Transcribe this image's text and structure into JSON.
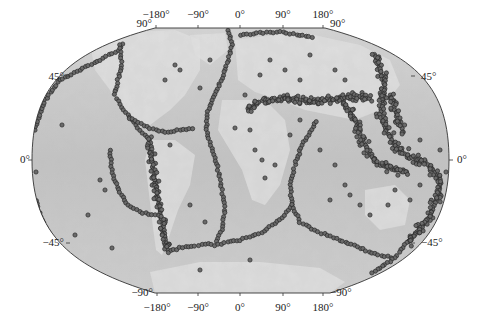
{
  "map": {
    "title": "",
    "projection": "winkel-like global",
    "frame": {
      "left": 32,
      "right": 449,
      "top": 28,
      "bottom": 293,
      "equator_y": 160,
      "top_flat": [
        155,
        325
      ],
      "bottom_flat": [
        155,
        330
      ]
    },
    "colors": {
      "ocean": "#c4c4c4",
      "land": "#e2e2e2",
      "land_high": "#f2f2f2",
      "dot_fill": "#6a6a6a",
      "dot_stroke": "#2a2a2a",
      "outline": "#333333"
    },
    "labels": {
      "top_lon": [
        {
          "text": "−180°",
          "x": 156,
          "y": 13
        },
        {
          "text": "−90°",
          "x": 198,
          "y": 13
        },
        {
          "text": "0°",
          "x": 240,
          "y": 13
        },
        {
          "text": "90°",
          "x": 283,
          "y": 13
        },
        {
          "text": "180°",
          "x": 323,
          "y": 13
        }
      ],
      "top_lat_left": {
        "text": "90°",
        "x": 150,
        "y": 23
      },
      "top_lat_right": {
        "text": "90°",
        "x": 332,
        "y": 23
      },
      "bottom_lon": [
        {
          "text": "−180°",
          "x": 157,
          "y": 300
        },
        {
          "text": "−90°",
          "x": 198,
          "y": 300
        },
        {
          "text": "0°",
          "x": 240,
          "y": 300
        },
        {
          "text": "90°",
          "x": 283,
          "y": 300
        },
        {
          "text": "180°",
          "x": 323,
          "y": 300
        }
      ],
      "bottom_lat_left": {
        "text": "−90°",
        "x": 150,
        "y": 290
      },
      "bottom_lat_right": {
        "text": "−90°",
        "x": 332,
        "y": 290
      },
      "left_lat": [
        {
          "text": "45°",
          "x": 62,
          "y": 72
        },
        {
          "text": "0°",
          "x": 30,
          "y": 155
        },
        {
          "text": "−45°",
          "x": 62,
          "y": 237
        }
      ],
      "right_lat": [
        {
          "text": "45°",
          "x": 420,
          "y": 72
        },
        {
          "text": "0°",
          "x": 455,
          "y": 155
        },
        {
          "text": "−45°",
          "x": 420,
          "y": 237
        }
      ]
    },
    "landmasses": [
      {
        "name": "north-america",
        "points": [
          [
            90,
            45
          ],
          [
            130,
            32
          ],
          [
            175,
            30
          ],
          [
            200,
            40
          ],
          [
            200,
            70
          ],
          [
            185,
            95
          ],
          [
            170,
            110
          ],
          [
            150,
            125
          ],
          [
            135,
            125
          ],
          [
            120,
            110
          ],
          [
            110,
            90
          ],
          [
            95,
            70
          ]
        ]
      },
      {
        "name": "south-america",
        "points": [
          [
            150,
            140
          ],
          [
            175,
            140
          ],
          [
            195,
            155
          ],
          [
            190,
            185
          ],
          [
            178,
            210
          ],
          [
            168,
            240
          ],
          [
            162,
            255
          ],
          [
            156,
            250
          ],
          [
            152,
            220
          ],
          [
            148,
            185
          ],
          [
            145,
            160
          ]
        ]
      },
      {
        "name": "greenland",
        "points": [
          [
            190,
            35
          ],
          [
            225,
            33
          ],
          [
            228,
            50
          ],
          [
            210,
            65
          ],
          [
            195,
            55
          ]
        ]
      },
      {
        "name": "eurasia",
        "points": [
          [
            235,
            40
          ],
          [
            300,
            32
          ],
          [
            360,
            45
          ],
          [
            390,
            60
          ],
          [
            400,
            85
          ],
          [
            380,
            110
          ],
          [
            355,
            120
          ],
          [
            330,
            115
          ],
          [
            305,
            110
          ],
          [
            280,
            100
          ],
          [
            255,
            92
          ],
          [
            238,
            80
          ]
        ]
      },
      {
        "name": "africa",
        "points": [
          [
            222,
            100
          ],
          [
            265,
            100
          ],
          [
            285,
            120
          ],
          [
            290,
            150
          ],
          [
            280,
            185
          ],
          [
            265,
            205
          ],
          [
            252,
            200
          ],
          [
            242,
            170
          ],
          [
            230,
            150
          ],
          [
            218,
            130
          ]
        ]
      },
      {
        "name": "australia",
        "points": [
          [
            365,
            190
          ],
          [
            395,
            185
          ],
          [
            410,
            200
          ],
          [
            405,
            225
          ],
          [
            380,
            230
          ],
          [
            365,
            215
          ]
        ]
      },
      {
        "name": "antarctica",
        "points": [
          [
            150,
            272
          ],
          [
            200,
            262
          ],
          [
            260,
            262
          ],
          [
            320,
            268
          ],
          [
            345,
            282
          ],
          [
            330,
            293
          ],
          [
            155,
            293
          ]
        ]
      }
    ],
    "seismic_belts": [
      {
        "name": "aleutian-alaska",
        "points": [
          [
            35,
            130
          ],
          [
            45,
            100
          ],
          [
            60,
            80
          ],
          [
            80,
            70
          ],
          [
            100,
            60
          ],
          [
            118,
            50
          ],
          [
            125,
            42
          ]
        ]
      },
      {
        "name": "north-american-west",
        "points": [
          [
            120,
            45
          ],
          [
            122,
            65
          ],
          [
            118,
            80
          ],
          [
            115,
            95
          ],
          [
            120,
            105
          ],
          [
            130,
            118
          ],
          [
            140,
            130
          ],
          [
            150,
            140
          ]
        ]
      },
      {
        "name": "central-america-caribbean",
        "points": [
          [
            130,
            118
          ],
          [
            150,
            128
          ],
          [
            165,
            132
          ],
          [
            180,
            130
          ],
          [
            195,
            128
          ]
        ]
      },
      {
        "name": "andes",
        "points": [
          [
            150,
            140
          ],
          [
            152,
            160
          ],
          [
            155,
            180
          ],
          [
            158,
            200
          ],
          [
            162,
            220
          ],
          [
            166,
            240
          ],
          [
            168,
            252
          ]
        ]
      },
      {
        "name": "east-pacific-rise",
        "points": [
          [
            110,
            150
          ],
          [
            112,
            170
          ],
          [
            118,
            190
          ],
          [
            128,
            205
          ],
          [
            140,
            212
          ],
          [
            155,
            215
          ],
          [
            165,
            218
          ]
        ]
      },
      {
        "name": "scotia-arc",
        "points": [
          [
            168,
            252
          ],
          [
            180,
            248
          ],
          [
            195,
            246
          ],
          [
            205,
            244
          ],
          [
            215,
            245
          ]
        ]
      },
      {
        "name": "mid-atlantic-ridge",
        "points": [
          [
            228,
            30
          ],
          [
            232,
            45
          ],
          [
            228,
            60
          ],
          [
            222,
            78
          ],
          [
            215,
            95
          ],
          [
            208,
            112
          ],
          [
            206,
            130
          ],
          [
            212,
            148
          ],
          [
            218,
            170
          ],
          [
            222,
            190
          ],
          [
            225,
            210
          ],
          [
            222,
            230
          ],
          [
            215,
            245
          ]
        ]
      },
      {
        "name": "southwest-indian-ridge",
        "points": [
          [
            215,
            245
          ],
          [
            240,
            240
          ],
          [
            262,
            232
          ],
          [
            280,
            220
          ],
          [
            292,
            205
          ]
        ]
      },
      {
        "name": "carlsberg-central-indian",
        "points": [
          [
            292,
            205
          ],
          [
            290,
            185
          ],
          [
            295,
            165
          ],
          [
            302,
            145
          ],
          [
            312,
            130
          ],
          [
            318,
            118
          ]
        ]
      },
      {
        "name": "southeast-indian-ridge",
        "points": [
          [
            292,
            205
          ],
          [
            300,
            222
          ],
          [
            318,
            232
          ],
          [
            340,
            240
          ],
          [
            360,
            248
          ],
          [
            378,
            255
          ],
          [
            395,
            258
          ]
        ]
      },
      {
        "name": "alpide-belt",
        "points": [
          [
            248,
            108
          ],
          [
            265,
            100
          ],
          [
            285,
            98
          ],
          [
            300,
            100
          ],
          [
            315,
            102
          ],
          [
            330,
            100
          ],
          [
            345,
            98
          ],
          [
            360,
            96
          ],
          [
            372,
            100
          ]
        ]
      },
      {
        "name": "himalaya-burma-sunda",
        "points": [
          [
            340,
            100
          ],
          [
            350,
            110
          ],
          [
            358,
            125
          ],
          [
            362,
            140
          ],
          [
            370,
            155
          ],
          [
            380,
            165
          ],
          [
            395,
            170
          ],
          [
            410,
            172
          ]
        ]
      },
      {
        "name": "kamchatka-japan",
        "points": [
          [
            375,
            55
          ],
          [
            380,
            70
          ],
          [
            385,
            85
          ],
          [
            383,
            100
          ],
          [
            380,
            115
          ],
          [
            385,
            128
          ]
        ]
      },
      {
        "name": "izu-mariana",
        "points": [
          [
            390,
            95
          ],
          [
            395,
            110
          ],
          [
            400,
            125
          ],
          [
            405,
            135
          ]
        ]
      },
      {
        "name": "philippine-newguinea",
        "points": [
          [
            385,
            128
          ],
          [
            392,
            140
          ],
          [
            400,
            150
          ],
          [
            412,
            158
          ],
          [
            425,
            162
          ]
        ]
      },
      {
        "name": "tonga-kermadec",
        "points": [
          [
            425,
            162
          ],
          [
            435,
            172
          ],
          [
            440,
            185
          ],
          [
            437,
            200
          ],
          [
            430,
            215
          ],
          [
            420,
            230
          ],
          [
            405,
            245
          ]
        ]
      },
      {
        "name": "macquarie",
        "points": [
          [
            405,
            245
          ],
          [
            395,
            258
          ],
          [
            380,
            268
          ],
          [
            370,
            275
          ]
        ]
      },
      {
        "name": "arctic-ridge",
        "points": [
          [
            240,
            35
          ],
          [
            260,
            33
          ],
          [
            280,
            32
          ],
          [
            300,
            35
          ],
          [
            315,
            38
          ]
        ]
      },
      {
        "name": "west-africa-left-edge",
        "points": [
          [
            36,
            200
          ],
          [
            38,
            210
          ],
          [
            42,
            220
          ],
          [
            46,
            228
          ],
          [
            50,
            235
          ]
        ]
      }
    ],
    "scattered_events": [
      [
        62,
        125
      ],
      [
        36,
        172
      ],
      [
        100,
        180
      ],
      [
        105,
        190
      ],
      [
        88,
        215
      ],
      [
        75,
        235
      ],
      [
        112,
        248
      ],
      [
        200,
        270
      ],
      [
        175,
        65
      ],
      [
        210,
        60
      ],
      [
        165,
        80
      ],
      [
        180,
        70
      ],
      [
        200,
        88
      ],
      [
        260,
        75
      ],
      [
        270,
        60
      ],
      [
        310,
        55
      ],
      [
        335,
        70
      ],
      [
        345,
        80
      ],
      [
        300,
        80
      ],
      [
        285,
        70
      ],
      [
        250,
        130
      ],
      [
        255,
        150
      ],
      [
        262,
        160
      ],
      [
        275,
        165
      ],
      [
        265,
        178
      ],
      [
        320,
        150
      ],
      [
        335,
        165
      ],
      [
        345,
        185
      ],
      [
        350,
        195
      ],
      [
        330,
        200
      ],
      [
        360,
        205
      ],
      [
        370,
        215
      ],
      [
        388,
        205
      ],
      [
        395,
        190
      ],
      [
        410,
        200
      ],
      [
        420,
        185
      ],
      [
        430,
        175
      ],
      [
        440,
        150
      ],
      [
        446,
        172
      ],
      [
        420,
        140
      ],
      [
        250,
        260
      ],
      [
        190,
        205
      ],
      [
        205,
        222
      ],
      [
        170,
        145
      ],
      [
        235,
        128
      ],
      [
        245,
        95
      ],
      [
        300,
        120
      ],
      [
        290,
        135
      ]
    ]
  }
}
